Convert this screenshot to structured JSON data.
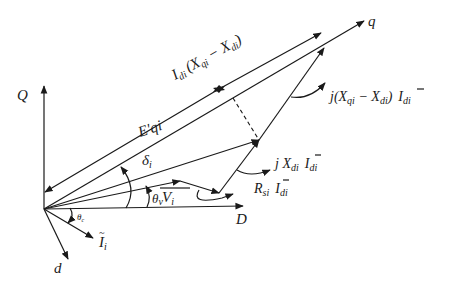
{
  "diagram": {
    "type": "phasor-diagram",
    "axes": {
      "Q": "Q",
      "D": "D",
      "q": "q",
      "d": "d"
    },
    "phasors": {
      "E_qi_prime": "E'qi",
      "V_i": "V",
      "V_i_sub": "i",
      "I_i": "I",
      "I_i_sub": "i"
    },
    "angles": {
      "delta": "δ",
      "delta_sub": "i",
      "theta_v": "θ",
      "theta_v_sub": "v",
      "theta_c": "θ",
      "theta_c_sub": "c"
    },
    "labels": {
      "idi_top": "I",
      "idi_top_sub": "di",
      "idi_top_expr": "(X",
      "idi_top_expr_sub1": "qi",
      "idi_top_minus": " − X",
      "idi_top_expr_sub2": "di",
      "idi_top_close": ")",
      "jx_diff_prefix": "j(X",
      "jx_diff_sub1": "qi",
      "jx_diff_minus": " − X",
      "jx_diff_sub2": "di",
      "jx_diff_close": ")",
      "jx_diff_I": "I",
      "jx_diff_I_sub": "di",
      "jxd_prefix": "j X",
      "jxd_sub": "di",
      "jxd_I": "I",
      "jxd_I_sub": "di",
      "rs_prefix": "R",
      "rs_sub": "si",
      "rs_I": "I",
      "rs_I_sub": "di"
    }
  }
}
